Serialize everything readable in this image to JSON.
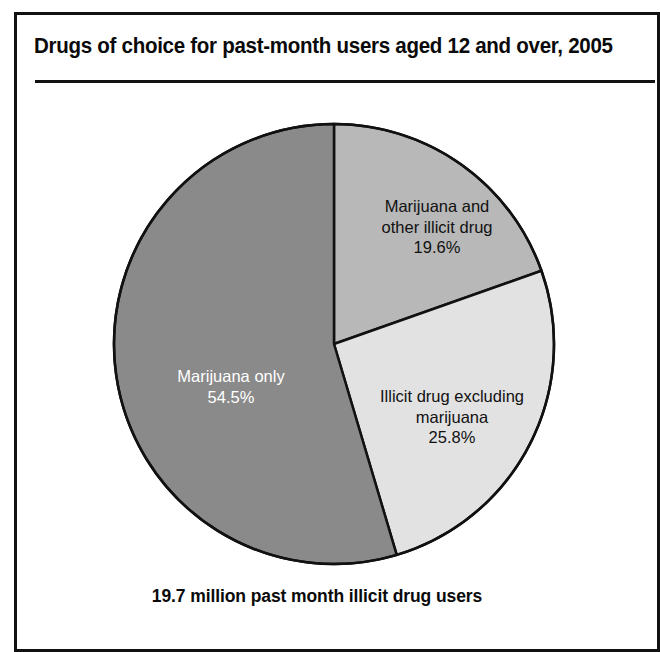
{
  "frame": {
    "border_color": "#111111",
    "background": "#ffffff"
  },
  "header": {
    "title": "Drugs of choice for past-month users aged 12 and over, 2005"
  },
  "caption": {
    "text": "19.7 million past month illicit drug users"
  },
  "labels": {
    "marijuana_and_other": {
      "line1": "Marijuana and",
      "line2": "other illicit drug",
      "percent": "19.6%"
    },
    "illicit_excluding_marijuana": {
      "line1": "Illicit drug excluding",
      "line2": "marijuana",
      "percent": "25.8%"
    },
    "marijuana_only": {
      "line1": "Marijuana only",
      "percent": "54.5%"
    }
  },
  "chart_data": {
    "type": "pie",
    "title": "Drugs of choice for past-month users aged 12 and over, 2005",
    "subtitle": "19.7 million past month illicit drug users",
    "total_label": "19.7 million past month illicit drug users",
    "total_millions": 19.7,
    "year": 2005,
    "start_angle_deg": 0,
    "direction": "clockwise",
    "units": "percent",
    "legend": "none (labels drawn inside slices)",
    "grid": false,
    "categories": [
      "Marijuana and other illicit drug",
      "Illicit drug excluding marijuana",
      "Marijuana only"
    ],
    "values": [
      19.6,
      25.8,
      54.5
    ],
    "slices": [
      {
        "label": "Marijuana and other illicit drug",
        "value": 19.6,
        "value_text": "19.6%",
        "color": "#b8b8b8",
        "label_color": "#111111",
        "start_deg": 0,
        "end_deg": 70.56
      },
      {
        "label": "Illicit drug excluding marijuana",
        "value": 25.8,
        "value_text": "25.8%",
        "color": "#e2e2e2",
        "label_color": "#111111",
        "start_deg": 70.56,
        "end_deg": 163.44
      },
      {
        "label": "Marijuana only",
        "value": 54.5,
        "value_text": "54.5%",
        "color": "#8a8a8a",
        "label_color": "#ffffff",
        "start_deg": 163.44,
        "end_deg": 360
      }
    ],
    "geometry": {
      "center_x": 334,
      "center_y": 344,
      "radius": 220,
      "outline_color": "#111111",
      "outline_width": 2.5
    }
  }
}
